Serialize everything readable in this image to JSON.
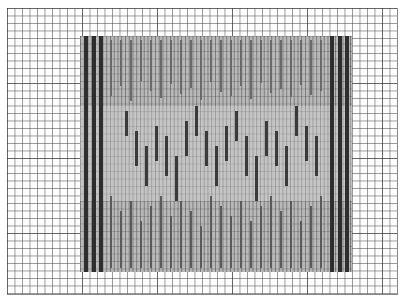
{
  "diagram": {
    "type": "weaving-draft-grid",
    "paper": {
      "cell_px": 7.5,
      "major_every": 10,
      "line_color": "#5a5a5a",
      "background": "#fdfdfd"
    },
    "block": {
      "fill": "#b9b9b9",
      "bar_color": "#3a3a3a"
    },
    "edge_columns": {
      "left": [
        {
          "x": 4,
          "y0": 0,
          "y1": 236
        },
        {
          "x": 12,
          "y0": 0,
          "y1": 236
        },
        {
          "x": 19,
          "y0": 0,
          "y1": 236
        }
      ],
      "right": [
        {
          "x": 250,
          "y0": 0,
          "y1": 236
        },
        {
          "x": 258,
          "y0": 0,
          "y1": 236
        },
        {
          "x": 265,
          "y0": 0,
          "y1": 236
        }
      ]
    },
    "interior_bars": [
      {
        "x": 45,
        "y0": 75,
        "y1": 100
      },
      {
        "x": 55,
        "y0": 95,
        "y1": 130
      },
      {
        "x": 65,
        "y0": 110,
        "y1": 150
      },
      {
        "x": 75,
        "y0": 90,
        "y1": 125
      },
      {
        "x": 85,
        "y0": 100,
        "y1": 140
      },
      {
        "x": 95,
        "y0": 120,
        "y1": 165
      },
      {
        "x": 105,
        "y0": 85,
        "y1": 120
      },
      {
        "x": 115,
        "y0": 70,
        "y1": 100
      },
      {
        "x": 125,
        "y0": 95,
        "y1": 130
      },
      {
        "x": 135,
        "y0": 110,
        "y1": 150
      },
      {
        "x": 145,
        "y0": 90,
        "y1": 125
      },
      {
        "x": 155,
        "y0": 75,
        "y1": 105
      },
      {
        "x": 165,
        "y0": 100,
        "y1": 140
      },
      {
        "x": 175,
        "y0": 120,
        "y1": 165
      },
      {
        "x": 185,
        "y0": 85,
        "y1": 120
      },
      {
        "x": 195,
        "y0": 95,
        "y1": 130
      },
      {
        "x": 205,
        "y0": 110,
        "y1": 150
      },
      {
        "x": 215,
        "y0": 70,
        "y1": 100
      },
      {
        "x": 225,
        "y0": 90,
        "y1": 125
      },
      {
        "x": 235,
        "y0": 100,
        "y1": 140
      }
    ],
    "lower_bars": [
      {
        "x": 30,
        "y0": 160,
        "y1": 232
      },
      {
        "x": 40,
        "y0": 175,
        "y1": 232
      },
      {
        "x": 50,
        "y0": 165,
        "y1": 232
      },
      {
        "x": 60,
        "y0": 185,
        "y1": 232
      },
      {
        "x": 70,
        "y0": 170,
        "y1": 232
      },
      {
        "x": 80,
        "y0": 160,
        "y1": 232
      },
      {
        "x": 90,
        "y0": 180,
        "y1": 232
      },
      {
        "x": 100,
        "y0": 165,
        "y1": 232
      },
      {
        "x": 110,
        "y0": 175,
        "y1": 232
      },
      {
        "x": 120,
        "y0": 190,
        "y1": 232
      },
      {
        "x": 130,
        "y0": 160,
        "y1": 232
      },
      {
        "x": 140,
        "y0": 170,
        "y1": 232
      },
      {
        "x": 150,
        "y0": 180,
        "y1": 232
      },
      {
        "x": 160,
        "y0": 165,
        "y1": 232
      },
      {
        "x": 170,
        "y0": 185,
        "y1": 232
      },
      {
        "x": 180,
        "y0": 170,
        "y1": 232
      },
      {
        "x": 190,
        "y0": 160,
        "y1": 232
      },
      {
        "x": 200,
        "y0": 175,
        "y1": 232
      },
      {
        "x": 210,
        "y0": 165,
        "y1": 232
      },
      {
        "x": 220,
        "y0": 185,
        "y1": 232
      },
      {
        "x": 230,
        "y0": 170,
        "y1": 232
      },
      {
        "x": 240,
        "y0": 160,
        "y1": 232
      }
    ],
    "upper_bars": [
      {
        "x": 30,
        "y0": 4,
        "y1": 60
      },
      {
        "x": 40,
        "y0": 4,
        "y1": 50
      },
      {
        "x": 50,
        "y0": 4,
        "y1": 65
      },
      {
        "x": 60,
        "y0": 4,
        "y1": 45
      },
      {
        "x": 70,
        "y0": 4,
        "y1": 55
      },
      {
        "x": 80,
        "y0": 4,
        "y1": 62
      },
      {
        "x": 90,
        "y0": 4,
        "y1": 48
      },
      {
        "x": 100,
        "y0": 4,
        "y1": 58
      },
      {
        "x": 110,
        "y0": 4,
        "y1": 52
      },
      {
        "x": 120,
        "y0": 4,
        "y1": 64
      },
      {
        "x": 130,
        "y0": 4,
        "y1": 46
      },
      {
        "x": 140,
        "y0": 4,
        "y1": 56
      },
      {
        "x": 150,
        "y0": 4,
        "y1": 60
      },
      {
        "x": 160,
        "y0": 4,
        "y1": 50
      },
      {
        "x": 170,
        "y0": 4,
        "y1": 63
      },
      {
        "x": 180,
        "y0": 4,
        "y1": 47
      },
      {
        "x": 190,
        "y0": 4,
        "y1": 57
      },
      {
        "x": 200,
        "y0": 4,
        "y1": 53
      },
      {
        "x": 210,
        "y0": 4,
        "y1": 61
      },
      {
        "x": 220,
        "y0": 4,
        "y1": 49
      },
      {
        "x": 230,
        "y0": 4,
        "y1": 59
      },
      {
        "x": 240,
        "y0": 4,
        "y1": 55
      }
    ]
  }
}
